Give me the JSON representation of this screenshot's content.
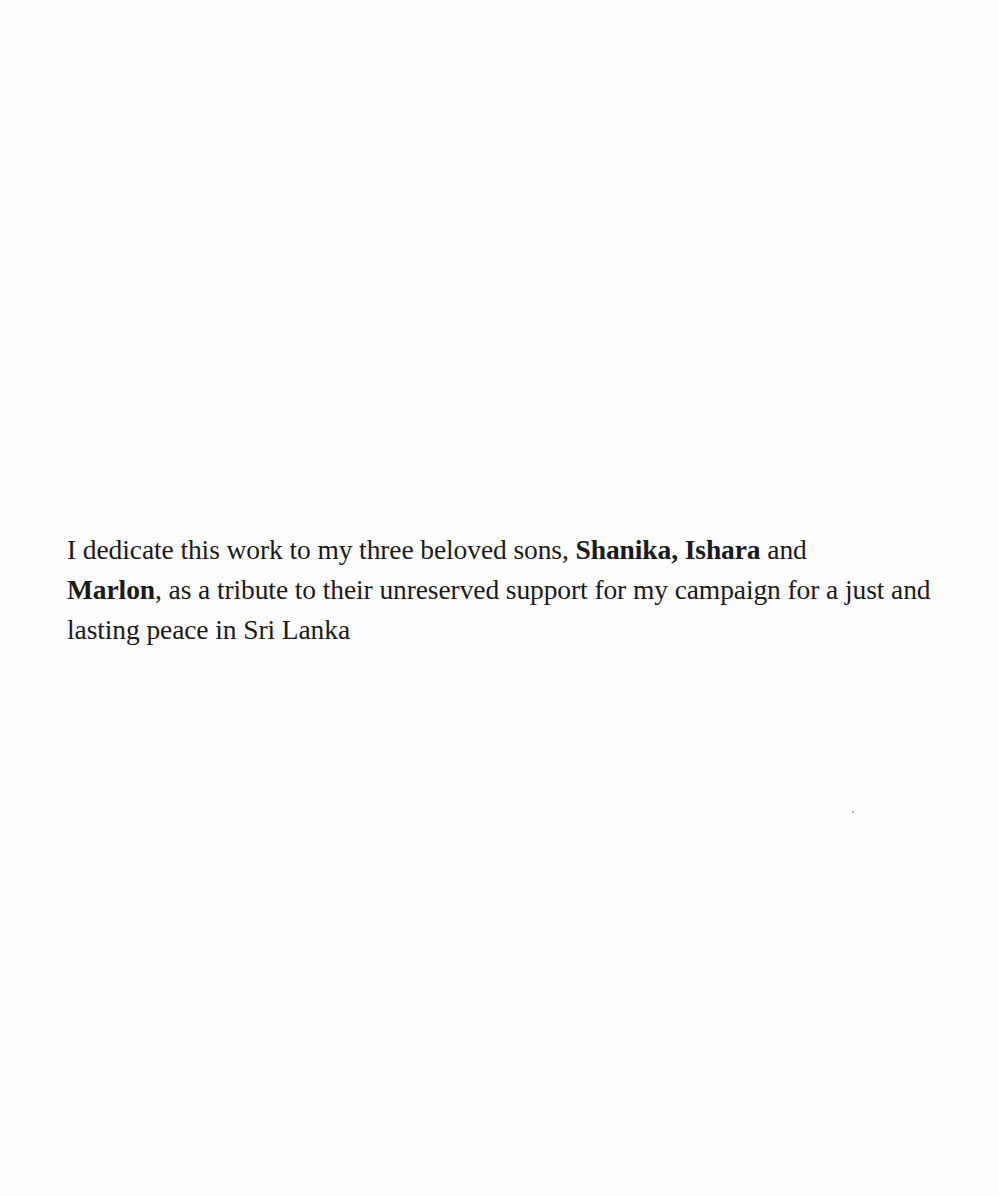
{
  "dedication": {
    "segments": [
      {
        "text": "I dedicate this work to my three beloved sons, ",
        "bold": false
      },
      {
        "text": "Shanika, Ishara",
        "bold": true
      },
      {
        "text": " and ",
        "bold": false
      },
      {
        "text": "Marlon",
        "bold": true
      },
      {
        "text": ", as a tribute to their unreserved support for my campaign for a just and lasting peace in Sri Lanka",
        "bold": false
      }
    ]
  }
}
